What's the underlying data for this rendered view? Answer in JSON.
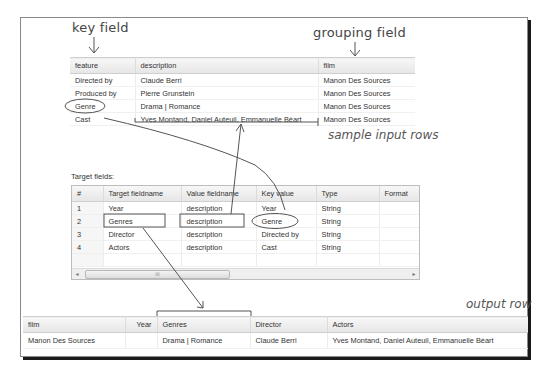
{
  "annotations": {
    "key_field": "key field",
    "grouping_field": "grouping field",
    "sample_input_rows": "sample input rows",
    "output_row": "output row"
  },
  "input_table": {
    "columns": [
      "feature",
      "description",
      "film"
    ],
    "rows": [
      [
        "Directed by",
        "Claude Berri",
        "Manon Des Sources"
      ],
      [
        "Produced by",
        "Pierre Grunstein",
        "Manon Des Sources"
      ],
      [
        "Genre",
        "Drama | Romance",
        "Manon Des Sources"
      ],
      [
        "Cast",
        "Yves Montand, Daniel Auteuil, Emmanuelle Béart",
        "Manon Des Sources"
      ]
    ]
  },
  "target_fields": {
    "label": "Target fields:",
    "columns": [
      "#",
      "Target fieldname",
      "Value fieldname",
      "Key value",
      "Type",
      "Format"
    ],
    "rows": [
      [
        "1",
        "Year",
        "description",
        "Year",
        "String",
        ""
      ],
      [
        "2",
        "Genres",
        "description",
        "Genre",
        "String",
        ""
      ],
      [
        "3",
        "Director",
        "description",
        "Directed by",
        "String",
        ""
      ],
      [
        "4",
        "Actors",
        "description",
        "Cast",
        "String",
        ""
      ]
    ],
    "scrollbar": {
      "left_arrow": "◂",
      "right_arrow": "▸",
      "thumb_grip": "III"
    }
  },
  "output_table": {
    "columns": [
      "film",
      "Year",
      "Genres",
      "Director",
      "Actors"
    ],
    "rows": [
      [
        "Manon Des Sources",
        "",
        "Drama | Romance",
        "Claude Berri",
        "Yves Montand, Daniel Auteuil, Emmanuelle Béart"
      ]
    ]
  },
  "colors": {
    "annotation_stroke": "#555555",
    "frame_shadow": "#1a1a1a",
    "header_bg": "#e9e9e9"
  }
}
